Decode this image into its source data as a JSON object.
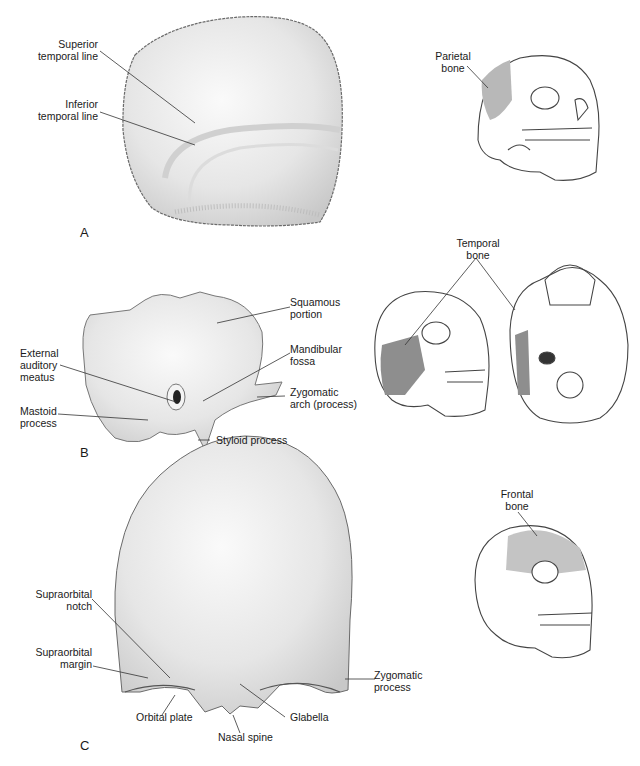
{
  "figure": {
    "panels": [
      {
        "id": "A",
        "letter": "A",
        "bone": "Parietal bone",
        "labels": {
          "superior_temporal_line": "Superior\ntemporal line",
          "inferior_temporal_line": "Inferior\ntemporal line",
          "locator": "Parietal\nbone"
        }
      },
      {
        "id": "B",
        "letter": "B",
        "bone": "Temporal bone",
        "labels": {
          "squamous_portion": "Squamous\nportion",
          "mandibular_fossa": "Mandibular\nfossa",
          "external_auditory_meatus": "External\nauditory\nmeatus",
          "zygomatic_arch": "Zygomatic\narch (process)",
          "mastoid_process": "Mastoid\nprocess",
          "styloid_process": "Styloid process",
          "locator": "Temporal\nbone"
        }
      },
      {
        "id": "C",
        "letter": "C",
        "bone": "Frontal bone",
        "labels": {
          "supraorbital_notch": "Supraorbital\nnotch",
          "supraorbital_margin": "Supraorbital\nmargin",
          "zygomatic_process": "Zygomatic\nprocess",
          "orbital_plate": "Orbital plate",
          "glabella": "Glabella",
          "nasal_spine": "Nasal spine",
          "locator": "Frontal\nbone"
        }
      }
    ],
    "colors": {
      "bone_fill": "#ececec",
      "bone_outline": "#6a6a6a",
      "highlight_fill": "#b5b5b5",
      "dark_highlight": "#8a8a8a",
      "leader_line": "#333333"
    }
  }
}
